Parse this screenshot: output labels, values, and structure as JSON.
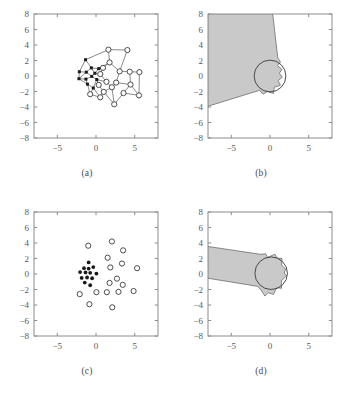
{
  "figure": {
    "panels": [
      {
        "id": "a",
        "caption": "(a)"
      },
      {
        "id": "b",
        "caption": "(b)"
      },
      {
        "id": "c",
        "caption": "(c)"
      },
      {
        "id": "d",
        "caption": "(d)"
      }
    ]
  },
  "axes": {
    "xlim": [
      -8,
      8
    ],
    "ylim": [
      -8,
      8
    ],
    "xticks": [
      -5,
      0,
      5
    ],
    "xtick_labels": [
      "-5",
      "0",
      "5"
    ],
    "yticks": [
      8,
      6,
      4,
      2,
      0,
      -2,
      -4,
      -6,
      -8
    ],
    "ytick_labels": [
      "8",
      "6",
      "4",
      "2",
      "0",
      "-2",
      "-4",
      "-6",
      "-8"
    ],
    "minor_xticks": [
      -7,
      -6,
      -4,
      -3,
      -2,
      -1,
      1,
      2,
      3,
      4,
      6,
      7
    ],
    "grid": false,
    "frame_color": "#8c8c8c",
    "tick_color": "#8c8c8c",
    "label_color": "#5a5a5a"
  },
  "colors": {
    "shade_fill": "#c9c9c9",
    "shade_stroke": "#6f6f6f",
    "edge": "#4a4a4a",
    "node_open_stroke": "#3a3a3a",
    "node_filled": "#1a1a1a",
    "circle_stroke": "#3a3a3a",
    "background": "#ffffff"
  },
  "chart_data": [
    {
      "type": "scatter",
      "panel": "a",
      "title": "",
      "xlabel": "",
      "ylabel": "",
      "xlim": [
        -8,
        8
      ],
      "ylim": [
        -8,
        8
      ],
      "grid": false,
      "description": "Network graph: anchor nodes (filled squares) and unknown nodes (open circles) joined by connectivity edges",
      "series": [
        {
          "name": "anchor-nodes",
          "marker": "filled-square",
          "points": [
            [
              -2.15,
              0.55
            ],
            [
              -2.2,
              -0.35
            ],
            [
              -1.35,
              2.1
            ],
            [
              -1.25,
              0.5
            ],
            [
              -1.3,
              -0.4
            ],
            [
              -1.1,
              -1.05
            ],
            [
              -0.55,
              -0.05
            ],
            [
              -0.6,
              1.05
            ],
            [
              -0.35,
              -1.55
            ],
            [
              -0.15,
              0.35
            ],
            [
              0.1,
              -0.45
            ],
            [
              0.35,
              0.95
            ]
          ]
        },
        {
          "name": "unknown-nodes",
          "marker": "open-circle",
          "points": [
            [
              1.6,
              3.4
            ],
            [
              4.05,
              3.35
            ],
            [
              1.75,
              1.75
            ],
            [
              3.05,
              0.6
            ],
            [
              4.35,
              0.55
            ],
            [
              5.6,
              0.5
            ],
            [
              0.55,
              0.25
            ],
            [
              1.35,
              -0.75
            ],
            [
              2.6,
              -0.85
            ],
            [
              4.45,
              -1.1
            ],
            [
              5.55,
              -2.5
            ],
            [
              3.55,
              -2.2
            ],
            [
              2.35,
              -3.65
            ],
            [
              1.0,
              -2.05
            ],
            [
              0.35,
              -1.15
            ],
            [
              -0.75,
              -2.35
            ],
            [
              0.55,
              -2.75
            ],
            [
              2.05,
              -1.45
            ],
            [
              0.9,
              1.05
            ]
          ]
        }
      ],
      "edges": [
        [
          -2.15,
          0.55,
          -2.2,
          -0.35
        ],
        [
          -2.15,
          0.55,
          -1.35,
          2.1
        ],
        [
          -2.15,
          0.55,
          -1.25,
          0.5
        ],
        [
          -2.2,
          -0.35,
          -1.3,
          -0.4
        ],
        [
          -2.2,
          -0.35,
          -1.25,
          0.5
        ],
        [
          -1.35,
          2.1,
          1.6,
          3.4
        ],
        [
          -1.35,
          2.1,
          -0.6,
          1.05
        ],
        [
          -1.25,
          0.5,
          -0.55,
          -0.05
        ],
        [
          -1.25,
          0.5,
          -0.6,
          1.05
        ],
        [
          -1.3,
          -0.4,
          -1.1,
          -1.05
        ],
        [
          -1.3,
          -0.4,
          -0.55,
          -0.05
        ],
        [
          -1.1,
          -1.05,
          -0.35,
          -1.55
        ],
        [
          -1.1,
          -1.05,
          -0.75,
          -2.35
        ],
        [
          -0.55,
          -0.05,
          -0.15,
          0.35
        ],
        [
          -0.55,
          -0.05,
          0.1,
          -0.45
        ],
        [
          -0.6,
          1.05,
          0.35,
          0.95
        ],
        [
          -0.6,
          1.05,
          -0.15,
          0.35
        ],
        [
          -0.35,
          -1.55,
          0.1,
          -0.45
        ],
        [
          -0.35,
          -1.55,
          0.55,
          -2.75
        ],
        [
          -0.15,
          0.35,
          0.55,
          0.25
        ],
        [
          -0.15,
          0.35,
          0.35,
          0.95
        ],
        [
          0.1,
          -0.45,
          1.35,
          -0.75
        ],
        [
          0.35,
          0.95,
          1.75,
          1.75
        ],
        [
          0.35,
          0.95,
          0.9,
          1.05
        ],
        [
          1.6,
          3.4,
          4.05,
          3.35
        ],
        [
          1.6,
          3.4,
          1.75,
          1.75
        ],
        [
          4.05,
          3.35,
          3.05,
          0.6
        ],
        [
          1.75,
          1.75,
          3.05,
          0.6
        ],
        [
          1.75,
          1.75,
          0.9,
          1.05
        ],
        [
          3.05,
          0.6,
          4.35,
          0.55
        ],
        [
          3.05,
          0.6,
          2.6,
          -0.85
        ],
        [
          4.35,
          0.55,
          5.6,
          0.5
        ],
        [
          4.35,
          0.55,
          4.45,
          -1.1
        ],
        [
          5.6,
          0.5,
          5.55,
          -2.5
        ],
        [
          0.55,
          0.25,
          1.35,
          -0.75
        ],
        [
          0.55,
          0.25,
          0.9,
          1.05
        ],
        [
          1.35,
          -0.75,
          2.05,
          -1.45
        ],
        [
          2.6,
          -0.85,
          4.45,
          -1.1
        ],
        [
          2.6,
          -0.85,
          2.05,
          -1.45
        ],
        [
          4.45,
          -1.1,
          5.55,
          -2.5
        ],
        [
          4.45,
          -1.1,
          3.55,
          -2.2
        ],
        [
          5.55,
          -2.5,
          3.55,
          -2.2
        ],
        [
          3.55,
          -2.2,
          2.35,
          -3.65
        ],
        [
          2.35,
          -3.65,
          1.0,
          -2.05
        ],
        [
          2.05,
          -1.45,
          2.35,
          -3.65
        ],
        [
          1.0,
          -2.05,
          0.35,
          -1.15
        ],
        [
          1.0,
          -2.05,
          0.55,
          -2.75
        ],
        [
          0.35,
          -1.15,
          0.1,
          -0.45
        ],
        [
          -0.75,
          -2.35,
          0.55,
          -2.75
        ],
        [
          -0.75,
          -2.35,
          -0.35,
          -1.55
        ],
        [
          2.05,
          -1.45,
          1.0,
          -2.05
        ],
        [
          -2.2,
          -0.35,
          -1.1,
          -1.05
        ],
        [
          0.1,
          -0.45,
          0.35,
          -1.15
        ]
      ]
    },
    {
      "type": "area",
      "panel": "b",
      "title": "",
      "xlabel": "",
      "ylabel": "",
      "xlim": [
        -8,
        8
      ],
      "ylim": [
        -8,
        8
      ],
      "grid": false,
      "description": "Shaded feasible region (wedge) from upper-left to lower-left, with reference circle radius 2 at origin and irregular polygon near origin",
      "shaded_polygon": [
        [
          -8,
          8
        ],
        [
          0.35,
          8
        ],
        [
          1.0,
          2.35
        ],
        [
          1.35,
          1.8
        ],
        [
          0.95,
          1.35
        ],
        [
          1.55,
          0.85
        ],
        [
          1.2,
          0.35
        ],
        [
          1.6,
          -0.15
        ],
        [
          1.05,
          -0.6
        ],
        [
          1.35,
          -1.2
        ],
        [
          0.55,
          -1.45
        ],
        [
          0.45,
          -2.25
        ],
        [
          -0.35,
          -2.0
        ],
        [
          -0.9,
          -2.35
        ],
        [
          -1.35,
          -1.85
        ],
        [
          -8,
          -3.9
        ]
      ],
      "circle": {
        "cx": 0.0,
        "cy": 0.0,
        "r": 2.05
      }
    },
    {
      "type": "scatter",
      "panel": "c",
      "title": "",
      "xlabel": "",
      "ylabel": "",
      "xlim": [
        -8,
        8
      ],
      "ylim": [
        -8,
        8
      ],
      "grid": false,
      "description": "Anchor nodes (filled dots) clustered near origin; unknown nodes (open circles) dispersed",
      "series": [
        {
          "name": "anchor-nodes",
          "marker": "filled-circle",
          "points": [
            [
              -0.95,
              1.5
            ],
            [
              -1.55,
              0.75
            ],
            [
              -0.95,
              0.7
            ],
            [
              -0.35,
              0.9
            ],
            [
              -2.05,
              0.25
            ],
            [
              -1.35,
              0.2
            ],
            [
              -0.75,
              0.15
            ],
            [
              0.05,
              0.05
            ],
            [
              -1.85,
              -0.5
            ],
            [
              -1.15,
              -0.45
            ],
            [
              -0.5,
              -0.55
            ],
            [
              -1.45,
              -1.1
            ],
            [
              -0.75,
              -1.45
            ]
          ]
        },
        {
          "name": "unknown-nodes",
          "marker": "open-circle",
          "points": [
            [
              -1.0,
              3.65
            ],
            [
              2.05,
              4.2
            ],
            [
              1.5,
              2.1
            ],
            [
              3.5,
              3.05
            ],
            [
              1.85,
              0.85
            ],
            [
              3.35,
              1.35
            ],
            [
              5.3,
              0.75
            ],
            [
              2.7,
              -0.6
            ],
            [
              1.75,
              -1.15
            ],
            [
              1.4,
              -2.35
            ],
            [
              2.9,
              -2.3
            ],
            [
              4.85,
              -2.2
            ],
            [
              -2.1,
              -2.6
            ],
            [
              -0.85,
              -3.9
            ],
            [
              2.1,
              -4.3
            ],
            [
              0.05,
              -2.35
            ],
            [
              3.45,
              -1.4
            ]
          ]
        }
      ]
    },
    {
      "type": "area",
      "panel": "d",
      "title": "",
      "xlabel": "",
      "ylabel": "",
      "xlim": [
        -8,
        8
      ],
      "ylim": [
        -8,
        8
      ],
      "grid": false,
      "description": "Shaded tapered band from left edge widening into blob near origin; reference circle radius 2 centered near (0.2, 0.1)",
      "shaded_polygon": [
        [
          -8,
          3.55
        ],
        [
          -1.3,
          2.55
        ],
        [
          -0.55,
          2.6
        ],
        [
          -0.3,
          2.15
        ],
        [
          0.65,
          2.55
        ],
        [
          0.9,
          2.05
        ],
        [
          1.55,
          2.0
        ],
        [
          1.5,
          1.15
        ],
        [
          2.0,
          0.65
        ],
        [
          1.85,
          0.1
        ],
        [
          2.15,
          -0.2
        ],
        [
          1.45,
          -0.9
        ],
        [
          1.5,
          -1.85
        ],
        [
          0.85,
          -1.75
        ],
        [
          0.45,
          -2.65
        ],
        [
          -0.25,
          -2.4
        ],
        [
          -0.65,
          -2.85
        ],
        [
          -1.15,
          -2.1
        ],
        [
          -1.55,
          -1.6
        ],
        [
          -8,
          -0.55
        ]
      ],
      "circle": {
        "cx": 0.15,
        "cy": 0.1,
        "r": 2.1
      }
    }
  ]
}
